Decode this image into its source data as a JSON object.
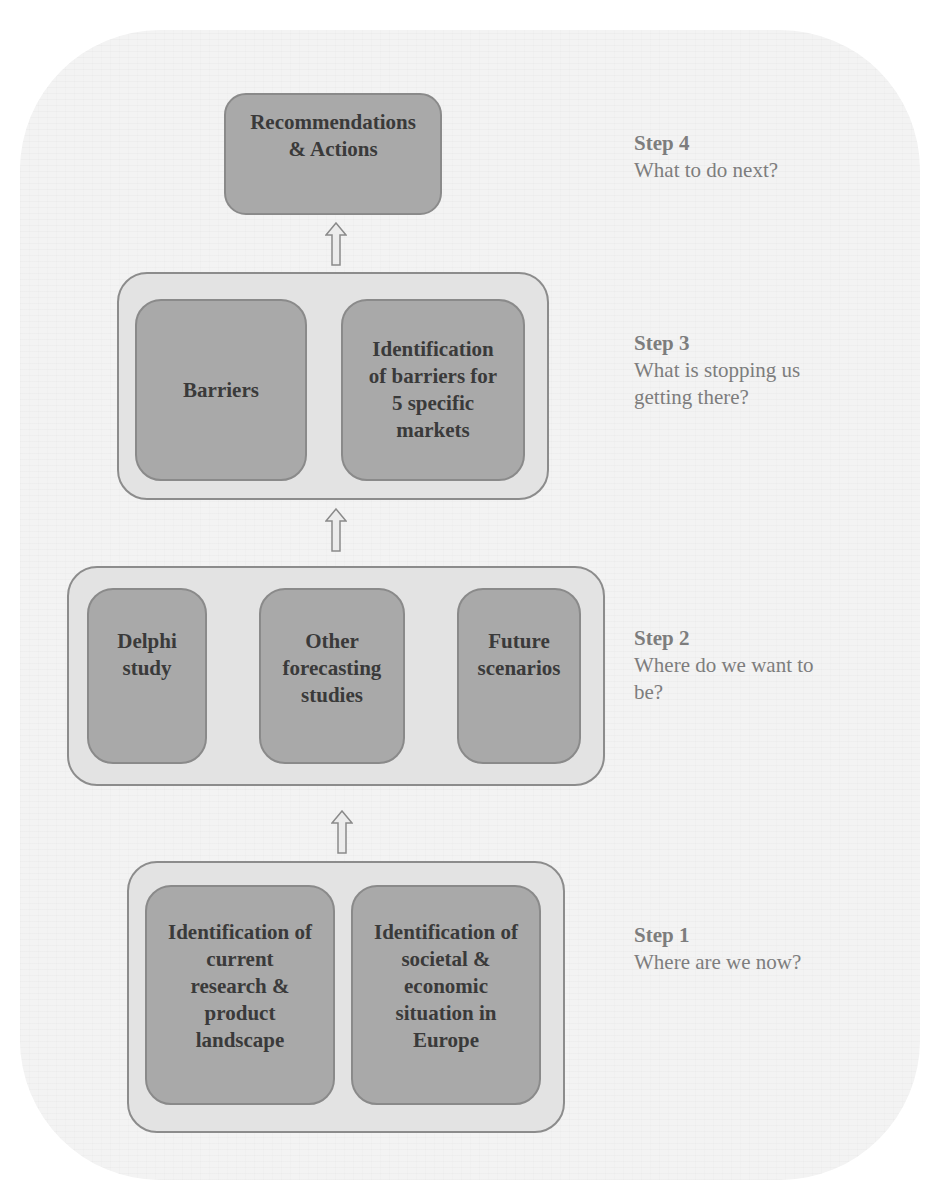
{
  "diagram": {
    "type": "stepwise-flow",
    "direction": "bottom-to-top",
    "colors": {
      "background": "#f3f3f3",
      "container_fill": "#e3e3e3",
      "box_fill": "#a9a9a9",
      "box_text": "#3a3a3a",
      "step_text": "#7d7d7d",
      "border": "#8c8c8c"
    },
    "steps": [
      {
        "id": "step4",
        "title": "Step 4",
        "question": "What to do next?",
        "boxes": [
          {
            "label": "Recommendations\n& Actions"
          }
        ]
      },
      {
        "id": "step3",
        "title": "Step 3",
        "question": "What is stopping us\ngetting there?",
        "boxes": [
          {
            "label": "Barriers"
          },
          {
            "label": "Identification\nof barriers for\n5 specific\nmarkets"
          }
        ]
      },
      {
        "id": "step2",
        "title": "Step 2",
        "question": "Where do we want to\nbe?",
        "boxes": [
          {
            "label": "Delphi\nstudy"
          },
          {
            "label": "Other\nforecasting\nstudies"
          },
          {
            "label": "Future\nscenarios"
          }
        ]
      },
      {
        "id": "step1",
        "title": "Step 1",
        "question": "Where are we now?",
        "boxes": [
          {
            "label": "Identification of\ncurrent\nresearch &\nproduct\nlandscape"
          },
          {
            "label": "Identification of\nsocietal &\neconomic\nsituation in\nEurope"
          }
        ]
      }
    ],
    "arrows": [
      {
        "from": "step1",
        "to": "step2",
        "icon": "up-arrow-icon"
      },
      {
        "from": "step2",
        "to": "step3",
        "icon": "up-arrow-icon"
      },
      {
        "from": "step3",
        "to": "step4",
        "icon": "up-arrow-icon"
      }
    ]
  }
}
